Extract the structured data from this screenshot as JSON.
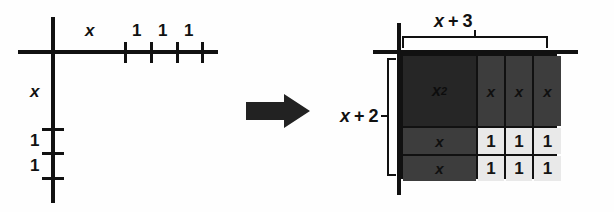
{
  "figure": {
    "transition_icon": "right-arrow-icon",
    "colors": {
      "ink": "#111111",
      "tile_x_squared": "#262626",
      "tile_x": "#3d3d3d",
      "tile_unit": "#e9e9e9",
      "background": "#ffffff"
    }
  },
  "left_diagram": {
    "name": "number-line-axes",
    "horizontal_axis": {
      "segment_labels": [
        "x",
        "1",
        "1",
        "1"
      ],
      "tick_count": 4
    },
    "vertical_axis": {
      "segment_labels": [
        "x",
        "1",
        "1"
      ],
      "tick_count": 3
    }
  },
  "right_diagram": {
    "name": "area-model-grid",
    "top_dimension": {
      "variable": "x",
      "operator": "+",
      "constant": "3",
      "label": "x + 3"
    },
    "left_dimension": {
      "variable": "x",
      "operator": "+",
      "constant": "2",
      "label": "x + 2"
    },
    "grid": {
      "columns": 4,
      "rows": 3,
      "cells": [
        [
          {
            "text": "x",
            "sup": "2",
            "kind": "x-squared"
          },
          {
            "text": "x",
            "sup": "",
            "kind": "x"
          },
          {
            "text": "x",
            "sup": "",
            "kind": "x"
          },
          {
            "text": "x",
            "sup": "",
            "kind": "x"
          }
        ],
        [
          {
            "text": "x",
            "sup": "",
            "kind": "x"
          },
          {
            "text": "1",
            "sup": "",
            "kind": "unit"
          },
          {
            "text": "1",
            "sup": "",
            "kind": "unit"
          },
          {
            "text": "1",
            "sup": "",
            "kind": "unit"
          }
        ],
        [
          {
            "text": "x",
            "sup": "",
            "kind": "x"
          },
          {
            "text": "1",
            "sup": "",
            "kind": "unit"
          },
          {
            "text": "1",
            "sup": "",
            "kind": "unit"
          },
          {
            "text": "1",
            "sup": "",
            "kind": "unit"
          }
        ]
      ]
    }
  }
}
